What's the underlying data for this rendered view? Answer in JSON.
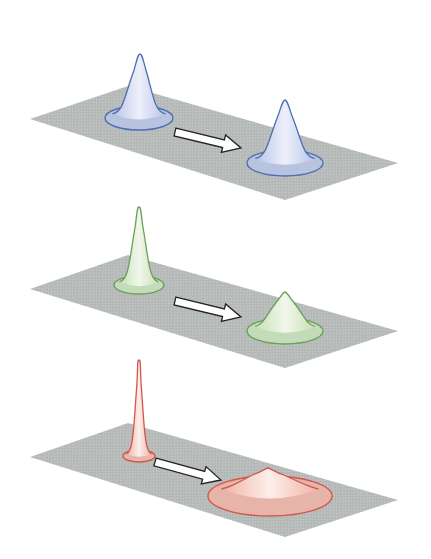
{
  "diagram": {
    "plane_color": "#b7bcbb",
    "arrow": {
      "fill": "#ffffff",
      "stroke": "#222222"
    },
    "panels": [
      {
        "id": "top",
        "color_name": "blue",
        "stroke": "#4f6fb0",
        "fill_light": "#eef0fb",
        "fill_dark": "#b9c4e6",
        "plane": [
          [
            30,
            119
          ],
          [
            128,
            86
          ],
          [
            398,
            163
          ],
          [
            285,
            200
          ]
        ],
        "arrow": {
          "from": [
            175,
            132
          ],
          "to": [
            241,
            148
          ]
        },
        "peaks": [
          {
            "label": "initial",
            "apex": [
              140,
              54
            ],
            "base_cx": 139,
            "base_cy": 118,
            "base_rx": 34,
            "base_ry": 12,
            "neck": 17
          },
          {
            "label": "final",
            "apex": [
              285,
              100
            ],
            "base_cx": 285,
            "base_cy": 163,
            "base_rx": 38,
            "base_ry": 13,
            "neck": 20
          }
        ]
      },
      {
        "id": "middle",
        "color_name": "green",
        "stroke": "#6aa05a",
        "fill_light": "#f1f7ec",
        "fill_dark": "#c7e0b8",
        "plane": [
          [
            30,
            289
          ],
          [
            128,
            255
          ],
          [
            398,
            331
          ],
          [
            285,
            368
          ]
        ],
        "arrow": {
          "from": [
            175,
            301
          ],
          "to": [
            241,
            317
          ]
        },
        "peaks": [
          {
            "label": "initial",
            "apex": [
              139,
              207
            ],
            "base_cx": 139,
            "base_cy": 285,
            "base_rx": 25,
            "base_ry": 9,
            "neck": 11
          },
          {
            "label": "final",
            "apex": [
              285,
              292
            ],
            "base_cx": 285,
            "base_cy": 331,
            "base_rx": 38,
            "base_ry": 13,
            "neck": 24
          }
        ]
      },
      {
        "id": "bottom",
        "color_name": "red",
        "stroke": "#d2564e",
        "fill_light": "#fbefea",
        "fill_dark": "#f0b3a6",
        "plane": [
          [
            30,
            457
          ],
          [
            128,
            423
          ],
          [
            398,
            500
          ],
          [
            285,
            537
          ]
        ],
        "arrow": {
          "from": [
            155,
            462
          ],
          "to": [
            221,
            480
          ]
        },
        "peaks": [
          {
            "label": "initial",
            "apex": [
              139,
              360
            ],
            "base_cx": 139,
            "base_cy": 456,
            "base_rx": 16,
            "base_ry": 6,
            "neck": 6
          },
          {
            "label": "final",
            "apex": [
              268,
              468
            ],
            "base_cx": 270,
            "base_cy": 496,
            "base_rx": 62,
            "base_ry": 20,
            "neck": 45
          }
        ]
      }
    ]
  }
}
